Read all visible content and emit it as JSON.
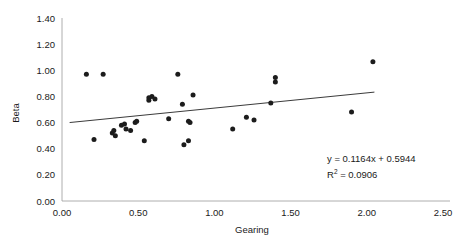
{
  "chart_data": {
    "type": "scatter",
    "title": "",
    "xlabel": "Gearing",
    "ylabel": "Beta",
    "xlim": [
      0.0,
      2.5
    ],
    "ylim": [
      0.0,
      1.4
    ],
    "xticks": [
      "0.00",
      "0.50",
      "1.00",
      "1.50",
      "2.00",
      "2.50"
    ],
    "xtick_values": [
      0.0,
      0.5,
      1.0,
      1.5,
      2.0,
      2.5
    ],
    "yticks": [
      "0.00",
      "0.20",
      "0.40",
      "0.60",
      "0.80",
      "1.00",
      "1.20",
      "1.40"
    ],
    "ytick_values": [
      0.0,
      0.2,
      0.4,
      0.6,
      0.8,
      1.0,
      1.2,
      1.4
    ],
    "grid": false,
    "legend": null,
    "marker_color": "#1c1c1c",
    "trendline_color": "#3b3b3b",
    "points": [
      {
        "x": 0.16,
        "y": 0.97
      },
      {
        "x": 0.27,
        "y": 0.97
      },
      {
        "x": 0.21,
        "y": 0.47
      },
      {
        "x": 0.33,
        "y": 0.52
      },
      {
        "x": 0.34,
        "y": 0.54
      },
      {
        "x": 0.35,
        "y": 0.5
      },
      {
        "x": 0.39,
        "y": 0.58
      },
      {
        "x": 0.41,
        "y": 0.59
      },
      {
        "x": 0.42,
        "y": 0.55
      },
      {
        "x": 0.45,
        "y": 0.54
      },
      {
        "x": 0.48,
        "y": 0.6
      },
      {
        "x": 0.49,
        "y": 0.61
      },
      {
        "x": 0.54,
        "y": 0.46
      },
      {
        "x": 0.57,
        "y": 0.79
      },
      {
        "x": 0.57,
        "y": 0.77
      },
      {
        "x": 0.59,
        "y": 0.8
      },
      {
        "x": 0.61,
        "y": 0.78
      },
      {
        "x": 0.7,
        "y": 0.63
      },
      {
        "x": 0.76,
        "y": 0.97
      },
      {
        "x": 0.79,
        "y": 0.74
      },
      {
        "x": 0.8,
        "y": 0.43
      },
      {
        "x": 0.83,
        "y": 0.46
      },
      {
        "x": 0.83,
        "y": 0.61
      },
      {
        "x": 0.84,
        "y": 0.6
      },
      {
        "x": 0.86,
        "y": 0.81
      },
      {
        "x": 1.12,
        "y": 0.55
      },
      {
        "x": 1.21,
        "y": 0.64
      },
      {
        "x": 1.26,
        "y": 0.62
      },
      {
        "x": 1.37,
        "y": 0.75
      },
      {
        "x": 1.4,
        "y": 0.945
      },
      {
        "x": 1.4,
        "y": 0.91
      },
      {
        "x": 1.9,
        "y": 0.68
      },
      {
        "x": 2.04,
        "y": 1.065
      }
    ],
    "trendline": {
      "slope": 0.1164,
      "intercept": 0.5944,
      "r_squared": 0.0906,
      "x_start": 0.05,
      "x_end": 2.05
    },
    "annotations": {
      "equation": "y = 0.1164x + 0.5944",
      "r2_prefix": "R",
      "r2_exponent": "2",
      "r2_value": " = 0.0906"
    }
  }
}
